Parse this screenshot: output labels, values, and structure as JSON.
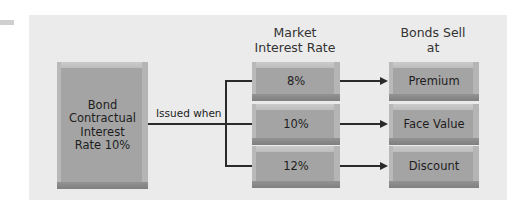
{
  "source": {
    "box_label": "Bond\nContractual\nInterest\nRate 10%",
    "box_lines": [
      "Bond",
      "Contractual",
      "Interest",
      "Rate 10%"
    ]
  },
  "connector_label": "Issued when",
  "market": {
    "heading_lines": [
      "Market",
      "Interest Rate"
    ],
    "rates": [
      "8%",
      "10%",
      "12%"
    ]
  },
  "outcome": {
    "heading_lines": [
      "Bonds Sell",
      "at"
    ],
    "results": [
      "Premium",
      "Face Value",
      "Discount"
    ]
  },
  "colors": {
    "panel_bg": "#ebebeb",
    "box_face": "#a4a4a4",
    "line": "#2a2a2a"
  }
}
